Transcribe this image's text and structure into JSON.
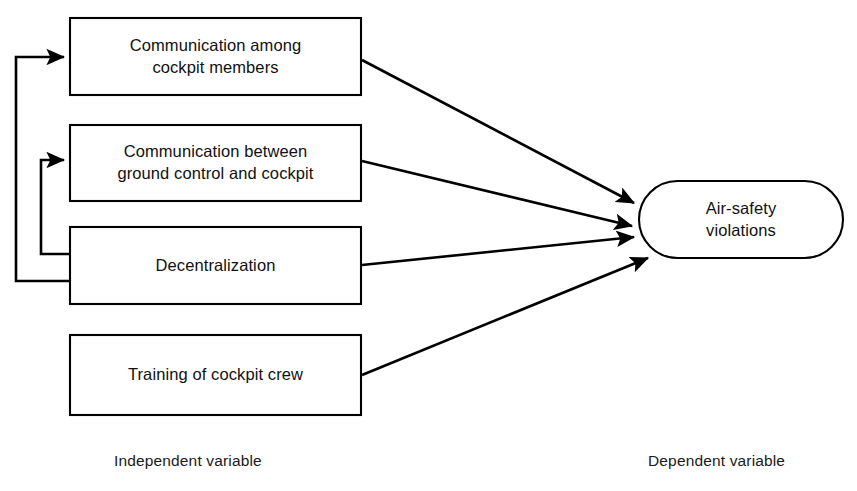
{
  "figure": {
    "type": "conceptual-model-diagram",
    "background_color": "#ffffff",
    "line_color": "#000000"
  },
  "independent_variables": {
    "caption": "Independent variable",
    "boxes": [
      {
        "id": "communication-among-cockpit-members",
        "label": "Communication among\ncockpit members"
      },
      {
        "id": "communication-ground-control-cockpit",
        "label": "Communication between\nground control and cockpit"
      },
      {
        "id": "decentralization",
        "label": "Decentralization"
      },
      {
        "id": "training-of-cockpit-crew",
        "label": "Training of cockpit crew"
      }
    ]
  },
  "dependent_variable": {
    "caption": "Dependent variable",
    "node": {
      "id": "air-safety-violations",
      "label": "Air-safety\nviolations"
    }
  },
  "relationships": [
    {
      "from": "communication-among-cockpit-members",
      "to": "air-safety-violations",
      "style": "arrow"
    },
    {
      "from": "communication-ground-control-cockpit",
      "to": "air-safety-violations",
      "style": "arrow"
    },
    {
      "from": "decentralization",
      "to": "air-safety-violations",
      "style": "arrow"
    },
    {
      "from": "training-of-cockpit-crew",
      "to": "air-safety-violations",
      "style": "arrow"
    },
    {
      "from": "decentralization",
      "to": "communication-among-cockpit-members",
      "style": "feedback-loop-outer"
    },
    {
      "from": "decentralization",
      "to": "communication-ground-control-cockpit",
      "style": "feedback-loop-inner"
    }
  ]
}
